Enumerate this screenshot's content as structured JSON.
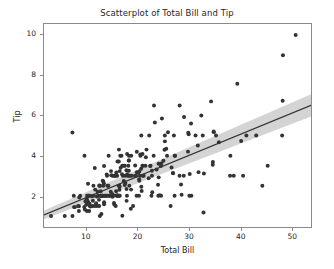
{
  "chart_data": {
    "type": "scatter",
    "title": "Scatterplot of Total Bill and Tip",
    "xlabel": "Total Bill",
    "ylabel": "Tip",
    "xlim": [
      1.7,
      53.8
    ],
    "ylim": [
      0.45,
      10.55
    ],
    "xticks": [
      10,
      20,
      30,
      40,
      50
    ],
    "yticks": [
      2,
      4,
      6,
      8,
      10
    ],
    "grid": false,
    "legend": null,
    "marker_color": "#333333",
    "marker_size": 4,
    "regression": {
      "shown": true,
      "line_color": "#333333",
      "band_color": "#d4d4d4",
      "slope": 0.105,
      "intercept": 0.87,
      "x_start": 1.7,
      "y_start": 1.05,
      "x_end": 53.8,
      "y_end": 6.5,
      "band_halfwidth_start": 0.22,
      "band_halfwidth_end": 0.55
    },
    "points": [
      [
        16.99,
        1.01
      ],
      [
        10.34,
        1.66
      ],
      [
        21.01,
        3.5
      ],
      [
        23.68,
        3.31
      ],
      [
        24.59,
        3.61
      ],
      [
        25.29,
        4.71
      ],
      [
        8.77,
        2.0
      ],
      [
        26.88,
        3.12
      ],
      [
        15.04,
        1.96
      ],
      [
        14.78,
        3.23
      ],
      [
        10.27,
        1.71
      ],
      [
        35.26,
        5.0
      ],
      [
        15.42,
        1.57
      ],
      [
        18.43,
        3.0
      ],
      [
        14.83,
        3.02
      ],
      [
        21.58,
        3.92
      ],
      [
        10.33,
        1.67
      ],
      [
        16.29,
        3.71
      ],
      [
        16.97,
        3.5
      ],
      [
        20.65,
        3.35
      ],
      [
        17.92,
        4.08
      ],
      [
        20.29,
        2.75
      ],
      [
        15.77,
        2.23
      ],
      [
        39.42,
        7.58
      ],
      [
        19.82,
        3.18
      ],
      [
        17.81,
        2.34
      ],
      [
        13.37,
        2.0
      ],
      [
        12.69,
        2.0
      ],
      [
        21.7,
        4.3
      ],
      [
        19.65,
        3.0
      ],
      [
        9.55,
        1.45
      ],
      [
        18.35,
        2.5
      ],
      [
        15.06,
        3.0
      ],
      [
        20.69,
        2.45
      ],
      [
        17.78,
        3.27
      ],
      [
        24.06,
        3.6
      ],
      [
        16.31,
        2.0
      ],
      [
        16.93,
        3.07
      ],
      [
        18.69,
        2.31
      ],
      [
        31.27,
        5.0
      ],
      [
        16.04,
        3.71
      ],
      [
        17.46,
        2.54
      ],
      [
        13.94,
        3.06
      ],
      [
        9.68,
        1.32
      ],
      [
        30.4,
        5.6
      ],
      [
        18.29,
        3.0
      ],
      [
        22.23,
        5.0
      ],
      [
        32.4,
        6.0
      ],
      [
        28.55,
        2.05
      ],
      [
        18.04,
        3.0
      ],
      [
        12.54,
        2.5
      ],
      [
        10.29,
        2.6
      ],
      [
        34.81,
        5.2
      ],
      [
        9.94,
        1.56
      ],
      [
        25.56,
        4.34
      ],
      [
        19.49,
        3.51
      ],
      [
        38.01,
        3.0
      ],
      [
        26.41,
        1.5
      ],
      [
        11.24,
        1.76
      ],
      [
        48.27,
        6.73
      ],
      [
        20.29,
        3.21
      ],
      [
        13.81,
        2.0
      ],
      [
        11.02,
        1.98
      ],
      [
        18.29,
        3.76
      ],
      [
        17.59,
        2.64
      ],
      [
        20.08,
        3.15
      ],
      [
        16.45,
        2.47
      ],
      [
        3.07,
        1.0
      ],
      [
        20.23,
        2.01
      ],
      [
        15.01,
        2.09
      ],
      [
        12.02,
        1.97
      ],
      [
        17.07,
        3.0
      ],
      [
        26.86,
        3.14
      ],
      [
        25.28,
        5.0
      ],
      [
        14.73,
        2.2
      ],
      [
        10.51,
        1.25
      ],
      [
        17.92,
        3.08
      ],
      [
        27.2,
        4.0
      ],
      [
        22.76,
        3.0
      ],
      [
        17.29,
        2.71
      ],
      [
        19.44,
        3.0
      ],
      [
        16.66,
        3.4
      ],
      [
        10.07,
        1.83
      ],
      [
        32.68,
        5.0
      ],
      [
        15.98,
        2.03
      ],
      [
        34.83,
        5.17
      ],
      [
        13.03,
        2.0
      ],
      [
        18.28,
        4.0
      ],
      [
        24.71,
        5.85
      ],
      [
        21.16,
        3.0
      ],
      [
        28.97,
        3.0
      ],
      [
        22.49,
        3.5
      ],
      [
        5.75,
        1.0
      ],
      [
        16.32,
        4.3
      ],
      [
        22.75,
        3.25
      ],
      [
        40.17,
        4.73
      ],
      [
        27.28,
        4.0
      ],
      [
        12.03,
        1.5
      ],
      [
        21.01,
        3.0
      ],
      [
        12.46,
        1.5
      ],
      [
        11.35,
        2.5
      ],
      [
        15.38,
        3.0
      ],
      [
        44.3,
        2.5
      ],
      [
        22.42,
        3.48
      ],
      [
        20.92,
        4.08
      ],
      [
        15.36,
        1.64
      ],
      [
        20.49,
        4.06
      ],
      [
        25.21,
        4.29
      ],
      [
        18.24,
        3.76
      ],
      [
        14.31,
        4.0
      ],
      [
        14.0,
        3.0
      ],
      [
        7.25,
        1.0
      ],
      [
        38.07,
        4.0
      ],
      [
        23.95,
        2.55
      ],
      [
        25.71,
        4.0
      ],
      [
        17.31,
        3.5
      ],
      [
        29.93,
        5.07
      ],
      [
        10.65,
        1.5
      ],
      [
        12.43,
        1.8
      ],
      [
        24.08,
        2.92
      ],
      [
        11.69,
        2.31
      ],
      [
        13.42,
        1.68
      ],
      [
        14.26,
        2.5
      ],
      [
        15.95,
        2.0
      ],
      [
        12.48,
        2.52
      ],
      [
        29.8,
        4.2
      ],
      [
        8.52,
        1.48
      ],
      [
        14.52,
        2.0
      ],
      [
        11.38,
        2.0
      ],
      [
        22.82,
        2.18
      ],
      [
        19.08,
        1.5
      ],
      [
        20.27,
        2.83
      ],
      [
        11.17,
        1.5
      ],
      [
        12.26,
        2.0
      ],
      [
        18.26,
        3.25
      ],
      [
        8.51,
        1.25
      ],
      [
        10.33,
        2.0
      ],
      [
        14.15,
        2.0
      ],
      [
        16.0,
        2.0
      ],
      [
        13.16,
        2.75
      ],
      [
        17.47,
        3.5
      ],
      [
        34.3,
        6.7
      ],
      [
        41.19,
        5.0
      ],
      [
        27.05,
        5.0
      ],
      [
        16.43,
        2.3
      ],
      [
        8.35,
        1.5
      ],
      [
        18.64,
        1.36
      ],
      [
        11.87,
        1.63
      ],
      [
        9.78,
        1.73
      ],
      [
        7.51,
        2.0
      ],
      [
        14.07,
        2.5
      ],
      [
        13.13,
        2.0
      ],
      [
        17.26,
        2.74
      ],
      [
        24.55,
        2.0
      ],
      [
        19.77,
        2.0
      ],
      [
        29.85,
        5.14
      ],
      [
        48.17,
        5.0
      ],
      [
        25.0,
        3.75
      ],
      [
        13.39,
        2.61
      ],
      [
        16.49,
        2.0
      ],
      [
        21.5,
        3.5
      ],
      [
        12.66,
        2.5
      ],
      [
        16.21,
        2.0
      ],
      [
        13.81,
        2.0
      ],
      [
        17.51,
        3.0
      ],
      [
        24.52,
        3.48
      ],
      [
        20.76,
        2.24
      ],
      [
        31.71,
        4.5
      ],
      [
        10.59,
        1.61
      ],
      [
        10.63,
        2.0
      ],
      [
        50.81,
        10.0
      ],
      [
        15.81,
        3.16
      ],
      [
        7.25,
        5.15
      ],
      [
        31.85,
        3.18
      ],
      [
        16.82,
        4.0
      ],
      [
        32.9,
        3.11
      ],
      [
        17.89,
        2.0
      ],
      [
        14.48,
        2.0
      ],
      [
        9.6,
        4.0
      ],
      [
        34.63,
        3.55
      ],
      [
        34.65,
        3.68
      ],
      [
        23.33,
        5.65
      ],
      [
        45.35,
        3.5
      ],
      [
        23.17,
        6.5
      ],
      [
        40.55,
        3.0
      ],
      [
        20.69,
        5.0
      ],
      [
        20.9,
        3.5
      ],
      [
        30.46,
        2.0
      ],
      [
        18.15,
        3.5
      ],
      [
        23.1,
        4.0
      ],
      [
        15.69,
        1.5
      ],
      [
        19.81,
        4.19
      ],
      [
        28.44,
        2.56
      ],
      [
        15.48,
        2.02
      ],
      [
        16.58,
        4.0
      ],
      [
        7.56,
        1.44
      ],
      [
        10.34,
        2.0
      ],
      [
        43.11,
        5.0
      ],
      [
        13.0,
        2.0
      ],
      [
        13.51,
        2.0
      ],
      [
        18.71,
        4.0
      ],
      [
        12.74,
        2.01
      ],
      [
        13.0,
        2.0
      ],
      [
        16.4,
        2.5
      ],
      [
        20.53,
        4.0
      ],
      [
        16.47,
        3.23
      ],
      [
        26.59,
        3.41
      ],
      [
        38.73,
        3.0
      ],
      [
        24.27,
        2.03
      ],
      [
        12.76,
        2.23
      ],
      [
        30.06,
        2.0
      ],
      [
        25.89,
        5.16
      ],
      [
        48.33,
        9.0
      ],
      [
        13.27,
        2.5
      ],
      [
        28.17,
        6.5
      ],
      [
        12.9,
        1.1
      ],
      [
        28.15,
        3.0
      ],
      [
        11.59,
        1.5
      ],
      [
        7.74,
        1.44
      ],
      [
        30.14,
        3.09
      ],
      [
        12.16,
        2.2
      ],
      [
        13.42,
        3.48
      ],
      [
        8.58,
        1.92
      ],
      [
        15.98,
        3.0
      ],
      [
        13.42,
        1.58
      ],
      [
        16.27,
        2.5
      ],
      [
        10.09,
        2.0
      ],
      [
        20.45,
        3.0
      ],
      [
        13.28,
        2.72
      ],
      [
        22.12,
        2.88
      ],
      [
        24.01,
        2.0
      ],
      [
        15.69,
        3.0
      ],
      [
        11.61,
        3.39
      ],
      [
        10.77,
        1.47
      ],
      [
        15.53,
        3.0
      ],
      [
        10.07,
        1.25
      ],
      [
        12.6,
        1.0
      ],
      [
        32.83,
        1.17
      ],
      [
        35.83,
        4.67
      ],
      [
        29.03,
        5.92
      ],
      [
        27.18,
        2.0
      ],
      [
        22.67,
        2.0
      ],
      [
        17.82,
        1.75
      ],
      [
        18.78,
        3.0
      ]
    ]
  }
}
